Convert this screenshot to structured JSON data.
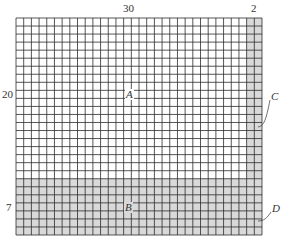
{
  "diagram": {
    "grid": {
      "columns": 32,
      "rows": 27,
      "left": 16,
      "top": 18,
      "width": 246,
      "height": 217,
      "line_color": "#2b2b2b",
      "shade_color": "#d9d9d9",
      "background": "#ffffff"
    },
    "regions": [
      {
        "id": "A",
        "label": "A",
        "col_start": 0,
        "col_end": 30,
        "row_start": 0,
        "row_end": 20,
        "shaded": false
      },
      {
        "id": "B",
        "label": "B",
        "col_start": 0,
        "col_end": 30,
        "row_start": 20,
        "row_end": 27,
        "shaded": true
      },
      {
        "id": "C",
        "label": "C",
        "col_start": 30,
        "col_end": 32,
        "row_start": 0,
        "row_end": 20,
        "shaded": true
      },
      {
        "id": "D",
        "label": "D",
        "col_start": 30,
        "col_end": 32,
        "row_start": 20,
        "row_end": 27,
        "shaded": true
      }
    ],
    "dimension_labels": {
      "top_main": "30",
      "top_side": "2",
      "left_main": "20",
      "left_side": "7"
    },
    "region_labels": {
      "a": "A",
      "b": "B",
      "c": "C",
      "d": "D"
    }
  }
}
